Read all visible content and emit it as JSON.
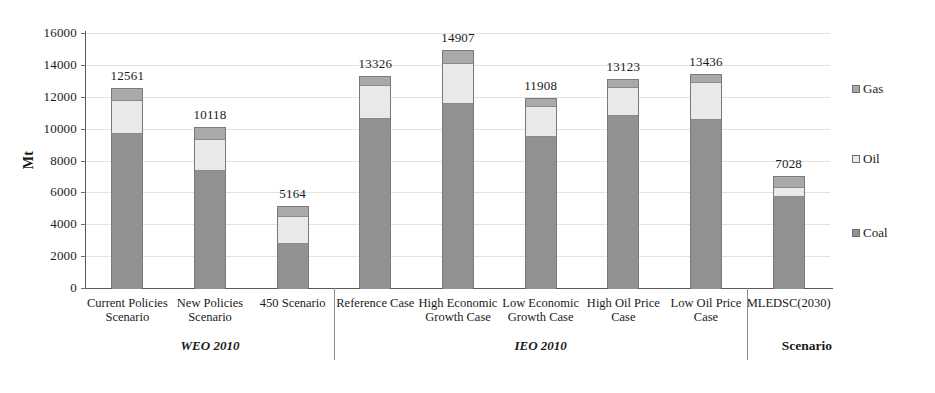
{
  "chart_data": {
    "type": "bar",
    "subtype": "stacked-column",
    "title": "",
    "xlabel": "Scenario",
    "ylabel": "Mt",
    "ylim": [
      0,
      16000
    ],
    "yticks": [
      0,
      2000,
      4000,
      6000,
      8000,
      10000,
      12000,
      14000,
      16000
    ],
    "grid": true,
    "legend_position": "right",
    "categories": [
      "Current Policies Scenario",
      "New Policies Scenario",
      "450 Scenario",
      "Reference Case",
      "High Economic Growth Case",
      "Low Economic Growth Case",
      "High Oil Price Case",
      "Low Oil Price Case",
      "MLEDSC(2030)"
    ],
    "series": [
      {
        "name": "Coal",
        "color": "#919191",
        "values": [
          9750,
          7400,
          2850,
          10650,
          11600,
          9550,
          10850,
          10600,
          5800
        ]
      },
      {
        "name": "Oil",
        "color": "#e9e9e9",
        "values": [
          2050,
          1950,
          1650,
          2100,
          2500,
          1850,
          1750,
          2300,
          550
        ]
      },
      {
        "name": "Gas",
        "color": "#a9a9a9",
        "values": [
          761,
          768,
          664,
          576,
          807,
          508,
          523,
          536,
          678
        ]
      }
    ],
    "totals": [
      12561,
      10118,
      5164,
      13326,
      14907,
      11908,
      13123,
      13436,
      7028
    ],
    "total_labels": [
      "12561",
      "10118",
      "5164",
      "13326",
      "14907",
      "11908",
      "13123",
      "13436",
      "7028"
    ],
    "groups": [
      {
        "label": "WEO 2010",
        "from": 0,
        "to": 2
      },
      {
        "label": "IEO 2010",
        "from": 3,
        "to": 7
      },
      {
        "label": "",
        "from": 8,
        "to": 8
      }
    ],
    "legend": [
      {
        "label": "Gas",
        "color": "#a9a9a9"
      },
      {
        "label": "Oil",
        "color": "#e9e9e9"
      },
      {
        "label": "Coal",
        "color": "#919191"
      }
    ]
  },
  "axis": {
    "y_title": "Mt",
    "x_title": "Scenario",
    "tick_labels": [
      "0",
      "2000",
      "4000",
      "6000",
      "8000",
      "10000",
      "12000",
      "14000",
      "16000"
    ]
  },
  "categories_wrapped": [
    [
      "Current Policies",
      "Scenario"
    ],
    [
      "New Policies",
      "Scenario"
    ],
    [
      "450 Scenario",
      ""
    ],
    [
      "Reference Case",
      ""
    ],
    [
      "High Economic",
      "Growth Case"
    ],
    [
      "Low Economic",
      "Growth Case"
    ],
    [
      "High Oil Price",
      "Case"
    ],
    [
      "Low Oil Price",
      "Case"
    ],
    [
      "MLEDSC(2030)",
      ""
    ]
  ],
  "group_labels": {
    "weo": "WEO 2010",
    "ieo": "IEO 2010"
  }
}
